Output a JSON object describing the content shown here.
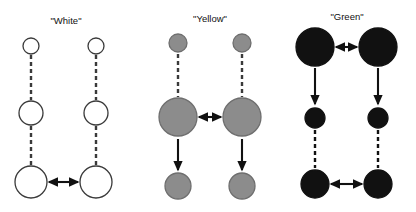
{
  "figure": {
    "width": 416,
    "height": 212,
    "background": "#ffffff",
    "colors": {
      "outline": "#3a3a3a",
      "white_fill": "#ffffff",
      "gray_fill": "#8c8c8c",
      "gray_outline": "#6e6e6e",
      "black_fill": "#111111",
      "arrow": "#111111",
      "title": "#111111"
    }
  },
  "panels": [
    {
      "id": "white",
      "title": "\"White\"",
      "title_x": 66,
      "title_y": 24,
      "fill": "#ffffff",
      "stroke": "#3a3a3a",
      "columns": [
        {
          "x": 31
        },
        {
          "x": 96
        }
      ],
      "nodes": [
        {
          "row": "top",
          "cy": 46,
          "r": 8
        },
        {
          "row": "middle",
          "cy": 113,
          "r": 12
        },
        {
          "row": "bottom",
          "cy": 182,
          "r": 16
        }
      ],
      "connectors": [
        {
          "type": "dashed",
          "from_row": "top",
          "to_row": "middle",
          "y1": 55,
          "y2": 100
        },
        {
          "type": "dashed",
          "from_row": "middle",
          "to_row": "bottom",
          "y1": 126,
          "y2": 165
        }
      ],
      "horizontal_arrow": {
        "row": "bottom",
        "y": 182,
        "x1": 49,
        "x2": 78,
        "heads": "both"
      }
    },
    {
      "id": "yellow",
      "title": "\"Yellow\"",
      "title_x": 210,
      "title_y": 22,
      "fill": "#8c8c8c",
      "stroke": "#6e6e6e",
      "columns": [
        {
          "x": 178
        },
        {
          "x": 242
        }
      ],
      "nodes": [
        {
          "row": "top",
          "cy": 43,
          "r": 9
        },
        {
          "row": "middle",
          "cy": 117,
          "r": 19
        },
        {
          "row": "bottom",
          "cy": 186,
          "r": 13
        }
      ],
      "connectors": [
        {
          "type": "dashed",
          "from_row": "top",
          "to_row": "middle",
          "y1": 54,
          "y2": 97
        },
        {
          "type": "arrow",
          "from_row": "middle",
          "to_row": "bottom",
          "y1": 139,
          "y2": 170
        }
      ],
      "horizontal_arrow": {
        "row": "middle",
        "y": 117,
        "x1": 199,
        "x2": 221,
        "heads": "both"
      }
    },
    {
      "id": "green",
      "title": "\"Green\"",
      "title_x": 347,
      "title_y": 20,
      "fill": "#111111",
      "stroke": "#111111",
      "columns": [
        {
          "x": 315
        },
        {
          "x": 378
        }
      ],
      "nodes": [
        {
          "row": "top",
          "cy": 47,
          "r": 19
        },
        {
          "row": "middle",
          "cy": 118,
          "r": 10
        },
        {
          "row": "bottom",
          "cy": 184,
          "r": 14
        }
      ],
      "connectors": [
        {
          "type": "arrow",
          "from_row": "top",
          "to_row": "middle",
          "y1": 68,
          "y2": 104
        },
        {
          "type": "dashed",
          "from_row": "middle",
          "to_row": "bottom",
          "y1": 130,
          "y2": 168
        }
      ],
      "horizontal_arrow": {
        "row": "top",
        "y": 47,
        "x1": 336,
        "x2": 357,
        "heads": "both"
      }
    }
  ],
  "style": {
    "dash_pattern": "4,3",
    "dash_width": 2.4,
    "arrow_width": 2.1,
    "circle_stroke_width": 1.3,
    "title_font_size": 9.5
  }
}
